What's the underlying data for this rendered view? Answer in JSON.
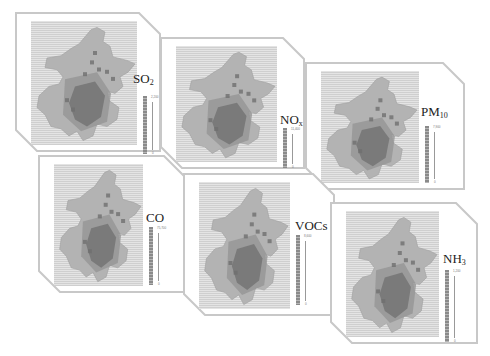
{
  "figure": {
    "panels": [
      {
        "id": "so2",
        "species": "SO",
        "subscript": "2",
        "legend_max": "2,200",
        "legend_min": "0",
        "x": 15,
        "y": 12,
        "w": 146,
        "h": 140,
        "lx": 118,
        "ly": 60,
        "legx": 128,
        "legy": 84,
        "legh": 58
      },
      {
        "id": "nox",
        "species": "NO",
        "subscript": "x",
        "legend_max": "11,400",
        "legend_min": "0",
        "x": 160,
        "y": 37,
        "w": 145,
        "h": 132,
        "lx": 120,
        "ly": 76,
        "legx": 123,
        "legy": 91,
        "legh": 40
      },
      {
        "id": "pm10",
        "species": "PM",
        "subscript": "10",
        "legend_max": "7,900",
        "legend_min": "0",
        "x": 305,
        "y": 62,
        "w": 160,
        "h": 128,
        "lx": 116,
        "ly": 43,
        "legx": 120,
        "legy": 64,
        "legh": 57
      },
      {
        "id": "co",
        "species": "CO",
        "subscript": "",
        "legend_max": "75,700",
        "legend_min": "0",
        "x": 38,
        "y": 155,
        "w": 148,
        "h": 138,
        "lx": 108,
        "ly": 56,
        "legx": 111,
        "legy": 72,
        "legh": 58
      },
      {
        "id": "vocs",
        "species": "VOCs",
        "subscript": "",
        "legend_max": "8,600",
        "legend_min": "0",
        "x": 183,
        "y": 173,
        "w": 152,
        "h": 143,
        "lx": 112,
        "ly": 46,
        "legx": 113,
        "legy": 62,
        "legh": 70
      },
      {
        "id": "nh3",
        "species": "NH",
        "subscript": "3",
        "legend_max": "1,200",
        "legend_min": "0",
        "x": 330,
        "y": 202,
        "w": 148,
        "h": 142,
        "lx": 113,
        "ly": 50,
        "legx": 115,
        "legy": 68,
        "legh": 72
      }
    ]
  },
  "colors": {
    "frame": "#c8c8c8",
    "grid_bg": "#d9d9d9",
    "map_light": "#b3b3b3",
    "map_mid": "#959595",
    "map_dark": "#6f6f6f",
    "legend": "#8a8a8a"
  }
}
